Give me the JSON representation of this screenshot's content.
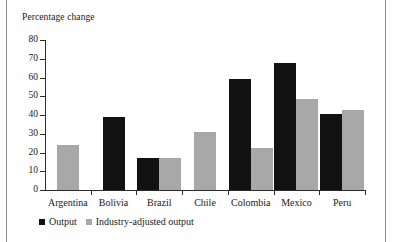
{
  "chart_data": {
    "type": "bar",
    "title": "",
    "subtitle": "",
    "ylabel": "Percentage change",
    "xlabel": "",
    "ylim": [
      0,
      80
    ],
    "yticks": [
      0,
      10,
      20,
      30,
      40,
      50,
      60,
      70,
      80
    ],
    "ytick_labels": [
      "0",
      "10",
      "20",
      "30",
      "40",
      "50",
      "60",
      "70",
      "80"
    ],
    "grid": false,
    "legend_position": "bottom-left",
    "categories": [
      "Argentina",
      "Bolivia",
      "Brazil",
      "Chile",
      "Colombia",
      "Mexico",
      "Peru"
    ],
    "series": [
      {
        "name": "Output",
        "color": "#121212",
        "values": [
          null,
          39,
          17,
          null,
          59,
          68,
          40.5
        ]
      },
      {
        "name": "Industry-adjusted output",
        "color": "#a8a8a8",
        "values": [
          24,
          null,
          17,
          31,
          22.5,
          48.5,
          42.5
        ]
      }
    ]
  },
  "legend": {
    "items": [
      {
        "label": "Output",
        "swatch": "output"
      },
      {
        "label": "Industry-adjusted output",
        "swatch": "adjusted"
      }
    ]
  },
  "colors": {
    "output": "#121212",
    "adjusted": "#a8a8a8",
    "axis": "#2b2b2b",
    "frame_rule": "#8e8e8e",
    "text": "#1a1a1a",
    "background": "#ffffff"
  }
}
